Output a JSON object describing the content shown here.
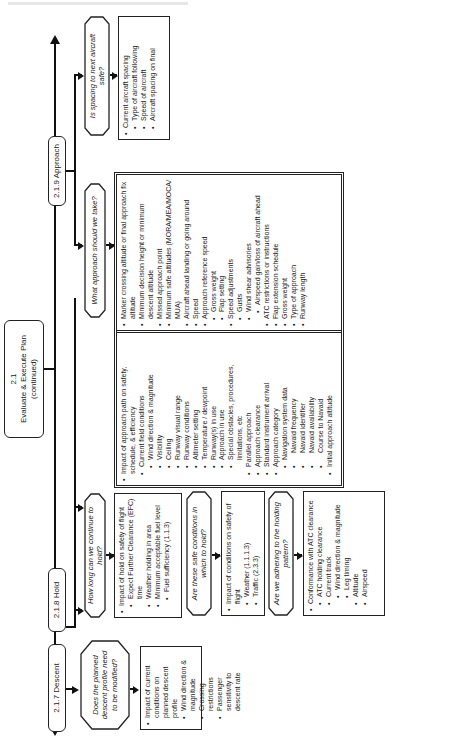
{
  "diagram": {
    "main_node": {
      "number": "2.1",
      "title": "Evaluate & Execute Plan",
      "subtitle": "(continued)"
    },
    "branches": [
      {
        "label": "2.1.7 Descent",
        "questions": [
          {
            "question": "Does the planned descent profile need to be modified?",
            "details": [
              {
                "level": 1,
                "text": "Impact of current conditions on planned descent profile"
              },
              {
                "level": 2,
                "text": "Wind direction & magnitude"
              },
              {
                "level": 2,
                "text": "Crossing restrictions"
              },
              {
                "level": 2,
                "text": "Passenger sensitivity to descent rate"
              }
            ]
          }
        ]
      },
      {
        "label": "2.1.8 Hold",
        "questions": [
          {
            "question": "How long can we continue to hold?",
            "details": [
              {
                "level": 1,
                "text": "Impact of hold on safety of flight"
              },
              {
                "level": 2,
                "text": "Expect Further Clearance (EFC) time"
              },
              {
                "level": 2,
                "text": "Weather holding in area"
              },
              {
                "level": 2,
                "text": "Minimum acceptable fuel level"
              },
              {
                "level": 3,
                "text": "Fuel sufficiency (1.1.3)"
              }
            ]
          },
          {
            "question": "Are these safe conditions in which to hold?",
            "details": [
              {
                "level": 1,
                "text": "Impact of conditions on safety of flight"
              },
              {
                "level": 2,
                "text": "Weather (1.1.1.3)"
              },
              {
                "level": 2,
                "text": "Traffic (2.3.3)"
              }
            ]
          },
          {
            "question": "Are we adhering to the holding pattern?",
            "details": [
              {
                "level": 1,
                "text": "Conformance with ATC clearance"
              },
              {
                "level": 2,
                "text": "ATC holding clearance"
              },
              {
                "level": 2,
                "text": "Current track"
              },
              {
                "level": 3,
                "text": "Wind direction & magnitude"
              },
              {
                "level": 3,
                "text": "Leg timing"
              },
              {
                "level": 2,
                "text": "Altitude"
              },
              {
                "level": 2,
                "text": "Airspeed"
              }
            ]
          }
        ]
      },
      {
        "label": "2.1.9 Approach",
        "questions": [
          {
            "question": "What approach should we take?",
            "details_left": [
              {
                "level": 1,
                "text": "Impact of approach path on safety, schedule, & efficiency"
              },
              {
                "level": 2,
                "text": "Current field conditions"
              },
              {
                "level": 3,
                "text": "Wind direction & magnitude"
              },
              {
                "level": 3,
                "text": "Visibility"
              },
              {
                "level": 3,
                "text": "Ceiling"
              },
              {
                "level": 3,
                "text": "Runway visual range"
              },
              {
                "level": 3,
                "text": "Runway conditions"
              },
              {
                "level": 3,
                "text": "Altimeter setting"
              },
              {
                "level": 3,
                "text": "Temperature / dewpoint"
              },
              {
                "level": 3,
                "text": "Runway(s) in use"
              },
              {
                "level": 3,
                "text": "Approach in use"
              },
              {
                "level": 3,
                "text": "Special obstacles, procedures, limitations, etc"
              },
              {
                "level": 2,
                "text": "Parallel approach"
              },
              {
                "level": 2,
                "text": "Approach clearance"
              },
              {
                "level": 2,
                "text": "Standard instrument arrival"
              },
              {
                "level": 2,
                "text": "Approach category"
              },
              {
                "level": 3,
                "text": "Navigation system data"
              },
              {
                "level": 4,
                "text": "Navaid frequency"
              },
              {
                "level": 4,
                "text": "Navaid identifier"
              },
              {
                "level": 4,
                "text": "Navaid availability"
              },
              {
                "level": 4,
                "text": "Course to Navaid"
              },
              {
                "level": 2,
                "text": "Initial approach altitude"
              }
            ],
            "details_right": [
              {
                "level": 2,
                "text": "Marker crossing altitude or final approach fix altitude"
              },
              {
                "level": 2,
                "text": "Minimum decision height or minimum descent altitude"
              },
              {
                "level": 2,
                "text": "Missed approach point"
              },
              {
                "level": 2,
                "text": "Minimum safe altitudes (MORA/MEA/MOCA/ MUA)"
              },
              {
                "level": 2,
                "text": "Aircraft ahead landing or going around"
              },
              {
                "level": 2,
                "text": "Speed"
              },
              {
                "level": 2,
                "text": "Approach reference speed"
              },
              {
                "level": 3,
                "text": "Gross weight"
              },
              {
                "level": 3,
                "text": "Flap setting"
              },
              {
                "level": 2,
                "text": "Speed adjustments"
              },
              {
                "level": 3,
                "text": "Gusts"
              },
              {
                "level": 3,
                "text": "Wind shear advisories"
              },
              {
                "level": 4,
                "text": "Airspeed gain/loss of aircraft ahead"
              },
              {
                "level": 2,
                "text": "ATC restrictions or instructions"
              },
              {
                "level": 2,
                "text": "Flap extension schedule"
              },
              {
                "level": 2,
                "text": "Gross weight"
              },
              {
                "level": 2,
                "text": "Type of approach"
              },
              {
                "level": 2,
                "text": "Runway length"
              }
            ]
          },
          {
            "question": "Is spacing to next aircraft safe?",
            "details": [
              {
                "level": 1,
                "text": "Current aircraft spacing"
              },
              {
                "level": 2,
                "text": "Type of aircraft following"
              },
              {
                "level": 2,
                "text": "Speed of aircraft"
              },
              {
                "level": 2,
                "text": "Aircraft spacing on final"
              }
            ]
          }
        ]
      }
    ]
  }
}
